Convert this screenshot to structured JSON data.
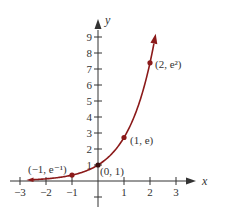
{
  "chart_data": {
    "type": "line",
    "title": "",
    "function": "y = e^x",
    "xlabel": "x",
    "ylabel": "y",
    "xlim": [
      -3,
      3
    ],
    "ylim": [
      0,
      9
    ],
    "grid": false,
    "x_ticks": [
      "-3",
      "-2",
      "-1",
      "1",
      "2",
      "3"
    ],
    "y_ticks": [
      "1",
      "2",
      "3",
      "4",
      "5",
      "6",
      "7",
      "8",
      "9"
    ],
    "series": [
      {
        "name": "e^x",
        "color": "#8b1a1a",
        "x": [
          -2.7,
          -2,
          -1,
          0,
          1,
          2,
          2.2
        ],
        "values": [
          0.067,
          0.135,
          0.368,
          1,
          2.718,
          7.389,
          9.025
        ]
      }
    ],
    "points": [
      {
        "x": -1,
        "y": 0.368,
        "label": "(−1, e⁻¹)"
      },
      {
        "x": 0,
        "y": 1,
        "label": "(0, 1)"
      },
      {
        "x": 1,
        "y": 2.718,
        "label": "(1, e)"
      },
      {
        "x": 2,
        "y": 7.389,
        "label": "(2, e²)"
      }
    ]
  },
  "axes": {
    "x_label": "x",
    "y_label": "y",
    "x_ticks": [
      {
        "v": -3,
        "label": "−3"
      },
      {
        "v": -2,
        "label": "−2"
      },
      {
        "v": -1,
        "label": "−1"
      },
      {
        "v": 1,
        "label": "1"
      },
      {
        "v": 2,
        "label": "2"
      },
      {
        "v": 3,
        "label": "3"
      }
    ],
    "y_ticks": [
      {
        "v": 1,
        "label": "1"
      },
      {
        "v": 2,
        "label": "2"
      },
      {
        "v": 3,
        "label": "3"
      },
      {
        "v": 4,
        "label": "4"
      },
      {
        "v": 5,
        "label": "5"
      },
      {
        "v": 6,
        "label": "6"
      },
      {
        "v": 7,
        "label": "7"
      },
      {
        "v": 8,
        "label": "8"
      },
      {
        "v": 9,
        "label": "9"
      }
    ]
  },
  "labels": {
    "pt_neg1": "(−1, e⁻¹)",
    "pt_0": "(0, 1)",
    "pt_1": "(1, e)",
    "pt_2": "(2, e²)"
  },
  "colors": {
    "curve": "#8b1a1a",
    "axis": "#333333"
  }
}
